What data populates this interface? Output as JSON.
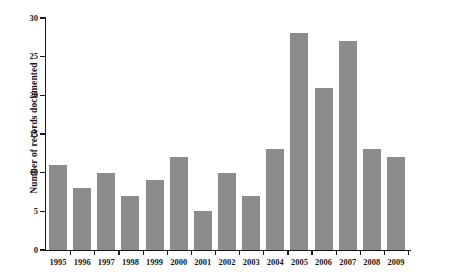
{
  "chart_data": {
    "type": "bar",
    "title": "",
    "subtitle": "",
    "xlabel": "",
    "ylabel": "Number of records documented",
    "categories": [
      "1995",
      "1996",
      "1997",
      "1998",
      "1999",
      "2000",
      "2001",
      "2002",
      "2003",
      "2004",
      "2005",
      "2006",
      "2007",
      "2008",
      "2009"
    ],
    "values": [
      11,
      8,
      10,
      7,
      9,
      12,
      5,
      10,
      7,
      13,
      28,
      21,
      27,
      13,
      12
    ],
    "ylim": [
      0,
      30
    ],
    "yticks": [
      0,
      5,
      10,
      15,
      20,
      25,
      30
    ],
    "ytick_labels": [
      "0",
      "5",
      "10",
      "15",
      "20",
      "25",
      "30"
    ],
    "grid": false,
    "legend": false,
    "legend_position": "none",
    "bar_color": "#8c8c8c",
    "axis_color": "#1a1a1a",
    "background_color": "#ffffff"
  }
}
